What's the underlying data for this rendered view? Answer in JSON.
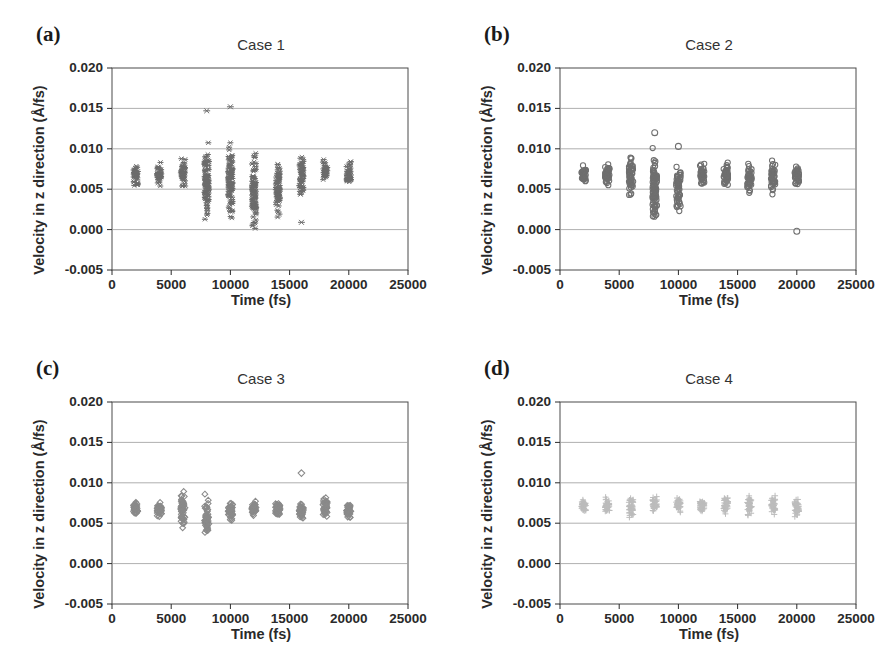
{
  "figure": {
    "panels": [
      {
        "tag": "(a)",
        "title": "Case 1",
        "marker": "asterisk",
        "color": "#6b6b6b"
      },
      {
        "tag": "(b)",
        "title": "Case 2",
        "marker": "circle",
        "color": "#6f6f6f"
      },
      {
        "tag": "(c)",
        "title": "Case 3",
        "marker": "diamond",
        "color": "#8a8a8a"
      },
      {
        "tag": "(d)",
        "title": "Case 4",
        "marker": "plus",
        "color": "#bcbcbc"
      }
    ]
  },
  "chart_data": [
    {
      "type": "scatter",
      "title": "Case 1",
      "panel": "(a)",
      "xlabel": "Time (fs)",
      "ylabel": "Velocity in z direction (Å/fs)",
      "xlim": [
        0,
        25000
      ],
      "ylim": [
        -0.005,
        0.02
      ],
      "xticks": [
        0,
        5000,
        10000,
        15000,
        20000,
        25000
      ],
      "yticks": [
        -0.005,
        0.0,
        0.005,
        0.01,
        0.015,
        0.02
      ],
      "ytick_labels": [
        "-0.005",
        "0.000",
        "0.005",
        "0.010",
        "0.015",
        "0.020"
      ],
      "xtick_labels": [
        "0",
        "5000",
        "10000",
        "15000",
        "20000",
        "25000"
      ],
      "grid": true,
      "marker": "asterisk",
      "marker_color": "#6b6b6b",
      "x": [
        2000,
        4000,
        6000,
        8000,
        10000,
        12000,
        14000,
        16000,
        18000,
        20000
      ],
      "y_ranges": [
        [
          0.005,
          0.0086
        ],
        [
          0.0052,
          0.0085
        ],
        [
          0.0044,
          0.0098
        ],
        [
          0.0,
          0.0115
        ],
        [
          0.0,
          0.0118
        ],
        [
          -0.0012,
          0.0101
        ],
        [
          0.0007,
          0.0097
        ],
        [
          0.0033,
          0.0099
        ],
        [
          0.0054,
          0.0089
        ],
        [
          0.0051,
          0.0088
        ]
      ],
      "outliers": [
        {
          "x": 8000,
          "y": 0.0147
        },
        {
          "x": 10000,
          "y": 0.0152
        },
        {
          "x": 16000,
          "y": 0.0009
        }
      ]
    },
    {
      "type": "scatter",
      "title": "Case 2",
      "panel": "(b)",
      "xlabel": "Time (fs)",
      "ylabel": "Velocity in z direction (Å/fs)",
      "xlim": [
        0,
        25000
      ],
      "ylim": [
        -0.005,
        0.02
      ],
      "xticks": [
        0,
        5000,
        10000,
        15000,
        20000,
        25000
      ],
      "yticks": [
        -0.005,
        0.0,
        0.005,
        0.01,
        0.015,
        0.02
      ],
      "ytick_labels": [
        "-0.005",
        "0.000",
        "0.005",
        "0.010",
        "0.015",
        "0.020"
      ],
      "xtick_labels": [
        "0",
        "5000",
        "10000",
        "15000",
        "20000",
        "25000"
      ],
      "grid": true,
      "marker": "circle",
      "marker_color": "#6f6f6f",
      "x": [
        2000,
        4000,
        6000,
        8000,
        10000,
        12000,
        14000,
        16000,
        18000,
        20000
      ],
      "y_ranges": [
        [
          0.0054,
          0.0083
        ],
        [
          0.0052,
          0.0086
        ],
        [
          0.0033,
          0.0097
        ],
        [
          0.0,
          0.0108
        ],
        [
          0.0017,
          0.0085
        ],
        [
          0.0052,
          0.0085
        ],
        [
          0.0051,
          0.0086
        ],
        [
          0.0038,
          0.0087
        ],
        [
          0.0037,
          0.0087
        ],
        [
          0.0049,
          0.0083
        ]
      ],
      "outliers": [
        {
          "x": 8000,
          "y": 0.012
        },
        {
          "x": 10000,
          "y": 0.0103
        },
        {
          "x": 20000,
          "y": -0.0002
        }
      ]
    },
    {
      "type": "scatter",
      "title": "Case 3",
      "panel": "(c)",
      "xlabel": "Time (fs)",
      "ylabel": "Velocity in z direction (Å/fs)",
      "xlim": [
        0,
        25000
      ],
      "ylim": [
        -0.005,
        0.02
      ],
      "xticks": [
        0,
        5000,
        10000,
        15000,
        20000,
        25000
      ],
      "yticks": [
        -0.005,
        0.0,
        0.005,
        0.01,
        0.015,
        0.02
      ],
      "ytick_labels": [
        "-0.005",
        "0.000",
        "0.005",
        "0.010",
        "0.015",
        "0.020"
      ],
      "xtick_labels": [
        "0",
        "5000",
        "10000",
        "15000",
        "20000",
        "25000"
      ],
      "grid": true,
      "marker": "diamond",
      "marker_color": "#8a8a8a",
      "x": [
        2000,
        4000,
        6000,
        8000,
        10000,
        12000,
        14000,
        16000,
        18000,
        20000
      ],
      "y_ranges": [
        [
          0.006,
          0.0078
        ],
        [
          0.0056,
          0.0078
        ],
        [
          0.0036,
          0.0096
        ],
        [
          0.0025,
          0.0088
        ],
        [
          0.005,
          0.0079
        ],
        [
          0.0057,
          0.0079
        ],
        [
          0.0057,
          0.0079
        ],
        [
          0.0052,
          0.0081
        ],
        [
          0.0052,
          0.0085
        ],
        [
          0.0051,
          0.008
        ]
      ],
      "outliers": [
        {
          "x": 16000,
          "y": 0.0112
        }
      ]
    },
    {
      "type": "scatter",
      "title": "Case 4",
      "panel": "(d)",
      "xlabel": "Time (fs)",
      "ylabel": "Velocity in z direction (Å/fs)",
      "xlim": [
        0,
        25000
      ],
      "ylim": [
        -0.005,
        0.02
      ],
      "xticks": [
        0,
        5000,
        10000,
        15000,
        20000,
        25000
      ],
      "yticks": [
        -0.005,
        0.0,
        0.005,
        0.01,
        0.015,
        0.02
      ],
      "ytick_labels": [
        "-0.005",
        "0.000",
        "0.005",
        "0.010",
        "0.015",
        "0.020"
      ],
      "xtick_labels": [
        "0",
        "5000",
        "10000",
        "15000",
        "20000",
        "25000"
      ],
      "grid": true,
      "marker": "plus",
      "marker_color": "#bcbcbc",
      "x": [
        2000,
        4000,
        6000,
        8000,
        10000,
        12000,
        14000,
        16000,
        18000,
        20000
      ],
      "y_ranges": [
        [
          0.0063,
          0.0082
        ],
        [
          0.006,
          0.0083
        ],
        [
          0.0052,
          0.0086
        ],
        [
          0.006,
          0.0087
        ],
        [
          0.0062,
          0.0084
        ],
        [
          0.0062,
          0.0082
        ],
        [
          0.006,
          0.0085
        ],
        [
          0.0058,
          0.009
        ],
        [
          0.0055,
          0.0088
        ],
        [
          0.0056,
          0.0084
        ]
      ],
      "outliers": []
    }
  ]
}
